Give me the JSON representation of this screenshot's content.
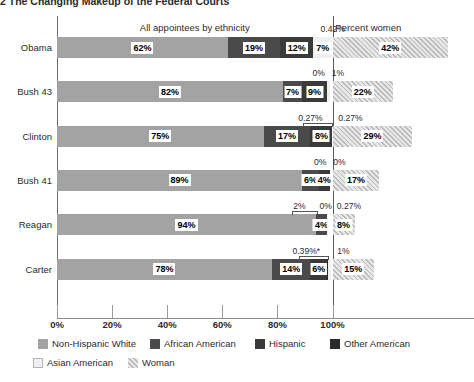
{
  "title": "2 The Changing Makeup of the Federal Courts",
  "headers": {
    "ethnicity": "All appointees by ethnicity",
    "women": "Percent women"
  },
  "axis": {
    "ticks": [
      "0%",
      "20%",
      "40%",
      "60%",
      "80%",
      "100%"
    ],
    "tick_values": [
      0,
      20,
      40,
      60,
      80,
      100
    ]
  },
  "legend": [
    {
      "label": "Non-Hispanic White",
      "key": "white",
      "color": "#a3a3a3"
    },
    {
      "label": "African American",
      "key": "black",
      "color": "#4a4a4a"
    },
    {
      "label": "Hispanic",
      "key": "hisp",
      "color": "#3a3a3a"
    },
    {
      "label": "Other American",
      "key": "other",
      "color": "#2b2b2b"
    },
    {
      "label": "Asian American",
      "key": "asian",
      "color": "#f0f0f0"
    },
    {
      "label": "Woman",
      "key": "woman",
      "color": "#d8d8d8"
    }
  ],
  "chart_data": {
    "type": "bar",
    "orientation": "horizontal",
    "stacked": true,
    "title": "2 The Changing Makeup of the Federal Courts",
    "xlabel": "",
    "ylabel": "",
    "xlim": [
      0,
      130
    ],
    "xticks": [
      0,
      20,
      40,
      60,
      80,
      100
    ],
    "xticklabels": [
      "0%",
      "20%",
      "40%",
      "60%",
      "80%",
      "100%"
    ],
    "grid": false,
    "legend_position": "bottom-left",
    "categories": [
      "Obama",
      "Bush 43",
      "Clinton",
      "Bush 41",
      "Reagan",
      "Carter"
    ],
    "series": [
      {
        "name": "Non-Hispanic White",
        "values": [
          62,
          82,
          75,
          89,
          94,
          78
        ]
      },
      {
        "name": "African American",
        "values": [
          19,
          7,
          17,
          6,
          4,
          14
        ]
      },
      {
        "name": "Hispanic",
        "values": [
          12,
          9,
          8,
          4,
          8,
          6
        ]
      },
      {
        "name": "Asian American",
        "values": [
          7,
          1,
          0.27,
          0,
          0.27,
          1
        ]
      },
      {
        "name": "Other American",
        "values": [
          0.42,
          0,
          0.27,
          0,
          0,
          0.39
        ]
      },
      {
        "name": "Woman",
        "values": [
          42,
          22,
          29,
          17,
          8,
          15
        ]
      }
    ],
    "annotations": [
      "0.42%",
      "0% 1%",
      "0.27% 0.27%",
      "0% 0%",
      "2% 0% 0.27%",
      "0.39%* 1%"
    ]
  },
  "rows": [
    {
      "label": "Obama",
      "segments": [
        {
          "key": "white",
          "value": 62,
          "label": "62%",
          "show": true
        },
        {
          "key": "black",
          "value": 19,
          "label": "19%",
          "show": true
        },
        {
          "key": "hisp",
          "value": 12,
          "label": "12%",
          "show": true
        },
        {
          "key": "asian",
          "value": 7,
          "label": "7%",
          "show": true
        },
        {
          "key": "other",
          "value": 0.42,
          "label": "",
          "show": false
        }
      ],
      "woman": {
        "value": 42,
        "label": "42%"
      },
      "callouts": [
        {
          "text": "0.42%",
          "x": 100.1,
          "leader": false
        }
      ]
    },
    {
      "label": "Bush 43",
      "segments": [
        {
          "key": "white",
          "value": 82,
          "label": "82%",
          "show": true
        },
        {
          "key": "black",
          "value": 7,
          "label": "7%",
          "show": true
        },
        {
          "key": "hisp",
          "value": 9,
          "label": "9%",
          "show": true
        },
        {
          "key": "other",
          "value": 0,
          "label": "",
          "show": false
        },
        {
          "key": "asian",
          "value": 1,
          "label": "",
          "show": false
        }
      ],
      "woman": {
        "value": 22,
        "label": "22%"
      },
      "callouts": [
        {
          "text": "0%",
          "x": 95.0,
          "leader": false
        },
        {
          "text": "1%",
          "x": 102.0,
          "leader": false
        }
      ]
    },
    {
      "label": "Clinton",
      "segments": [
        {
          "key": "white",
          "value": 75,
          "label": "75%",
          "show": true
        },
        {
          "key": "black",
          "value": 17,
          "label": "17%",
          "show": true
        },
        {
          "key": "hisp",
          "value": 8,
          "label": "8%",
          "show": true
        },
        {
          "key": "other",
          "value": 0.27,
          "label": "",
          "show": false
        },
        {
          "key": "asian",
          "value": 0.27,
          "label": "",
          "show": false
        }
      ],
      "woman": {
        "value": 29,
        "label": "29%"
      },
      "callouts": [
        {
          "text": "0.27%",
          "x": 92.0,
          "leader": true,
          "tip": 99.7
        },
        {
          "text": "0.27%",
          "x": 106.5,
          "leader": false
        }
      ]
    },
    {
      "label": "Bush 41",
      "segments": [
        {
          "key": "white",
          "value": 89,
          "label": "89%",
          "show": true
        },
        {
          "key": "black",
          "value": 6,
          "label": "6%",
          "show": true
        },
        {
          "key": "hisp",
          "value": 4,
          "label": "4%",
          "show": true
        },
        {
          "key": "other",
          "value": 0,
          "label": "",
          "show": false
        },
        {
          "key": "asian",
          "value": 0,
          "label": "",
          "show": false
        }
      ],
      "woman": {
        "value": 17,
        "label": "17%"
      },
      "callouts": [
        {
          "text": "0%",
          "x": 95.5,
          "leader": false
        },
        {
          "text": "0%",
          "x": 102.5,
          "leader": false
        }
      ]
    },
    {
      "label": "Reagan",
      "segments": [
        {
          "key": "white",
          "value": 94,
          "label": "94%",
          "show": true
        },
        {
          "key": "black",
          "value": 4,
          "label": "4%",
          "show": true
        },
        {
          "key": "other",
          "value": 0,
          "label": "",
          "show": false
        },
        {
          "key": "asian",
          "value": 0.27,
          "label": "",
          "show": false
        }
      ],
      "woman": {
        "value": 8,
        "label": "8%"
      },
      "callouts": [
        {
          "text": "2%",
          "x": 88.0,
          "leader": true,
          "tip": 94.2
        },
        {
          "text": "0%",
          "x": 97.5,
          "leader": false
        },
        {
          "text": "0.27%",
          "x": 106.0,
          "leader": false
        }
      ]
    },
    {
      "label": "Carter",
      "segments": [
        {
          "key": "white",
          "value": 78,
          "label": "78%",
          "show": true
        },
        {
          "key": "black",
          "value": 14,
          "label": "14%",
          "show": true
        },
        {
          "key": "hisp",
          "value": 6,
          "label": "6%",
          "show": true
        },
        {
          "key": "other",
          "value": 0.39,
          "label": "",
          "show": false
        },
        {
          "key": "asian",
          "value": 1,
          "label": "",
          "show": false
        }
      ],
      "woman": {
        "value": 15,
        "label": "15%"
      },
      "callouts": [
        {
          "text": "0.39%*",
          "x": 90.5,
          "leader": true,
          "tip": 98.5
        },
        {
          "text": "1%",
          "x": 104.0,
          "leader": false
        }
      ]
    }
  ]
}
